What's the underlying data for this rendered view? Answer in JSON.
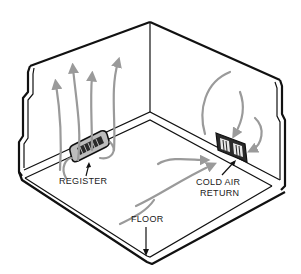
{
  "diagram": {
    "labels": {
      "register": "REGISTER",
      "cold_air_return_line1": "COLD AIR",
      "cold_air_return_line2": "RETURN",
      "floor": "FLOOR"
    },
    "colors": {
      "line": "#111111",
      "airflow": "#9a9a9a",
      "background": "#ffffff"
    }
  }
}
